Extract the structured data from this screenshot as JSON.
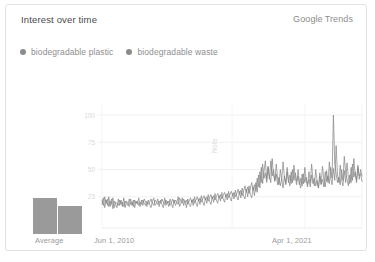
{
  "card": {
    "title": "Interest over time",
    "brand": {
      "google": "Google",
      "trends": "Trends"
    }
  },
  "legend": {
    "items": [
      {
        "label": "biodegradable plastic",
        "color": "#8c8c8c"
      },
      {
        "label": "biodegradable waste",
        "color": "#8c8c8c"
      }
    ]
  },
  "annotation": {
    "note": "Note"
  },
  "average": {
    "tick_label": "Average",
    "bars": [
      {
        "series": "biodegradable plastic",
        "value": 24
      },
      {
        "series": "biodegradable waste",
        "value": 19
      }
    ]
  },
  "axis": {
    "x_ticks": [
      "Jun 1, 2010",
      "Apr 1, 2021"
    ],
    "y_ticks": [
      "100",
      "75",
      "50",
      "25"
    ]
  },
  "chart_data": {
    "type": "line",
    "title": "Interest over time",
    "xlabel": "",
    "ylabel": "",
    "ylim": [
      0,
      100
    ],
    "grid": true,
    "legend_position": "top-left",
    "x_tick_labels": [
      "Jun 1, 2010",
      "Apr 1, 2021"
    ],
    "y_tick_labels": [
      100,
      75,
      50,
      25
    ],
    "series": [
      {
        "name": "biodegradable plastic",
        "color": "#8c8c8c",
        "values": [
          22,
          17,
          25,
          19,
          23,
          16,
          21,
          18,
          24,
          15,
          20,
          19,
          17,
          22,
          18,
          20,
          16,
          21,
          19,
          17,
          23,
          18,
          20,
          16,
          22,
          19,
          21,
          17,
          20,
          18,
          22,
          19,
          17,
          21,
          18,
          20,
          23,
          19,
          17,
          22,
          20,
          18,
          21,
          19,
          23,
          20,
          18,
          22,
          19,
          21,
          17,
          20,
          23,
          19,
          22,
          20,
          18,
          24,
          21,
          19,
          23,
          20,
          22,
          18,
          21,
          24,
          20,
          23,
          19,
          22,
          25,
          21,
          24,
          20,
          23,
          26,
          22,
          25,
          21,
          24,
          27,
          23,
          26,
          22,
          25,
          28,
          24,
          27,
          23,
          26,
          29,
          25,
          28,
          24,
          27,
          30,
          26,
          29,
          25,
          28,
          32,
          27,
          31,
          26,
          30,
          35,
          29,
          34,
          28,
          33,
          38,
          31,
          36,
          30,
          42,
          34,
          48,
          38,
          55,
          42,
          47,
          38,
          52,
          41,
          58,
          44,
          50,
          40,
          46,
          36,
          43,
          35,
          41,
          33,
          44,
          36,
          48,
          38,
          45,
          37,
          50,
          40,
          47,
          39,
          44,
          36,
          42,
          35,
          46,
          38,
          43,
          36,
          41,
          34,
          45,
          37,
          42,
          35,
          40,
          33,
          44,
          36,
          41,
          34,
          48,
          39,
          44,
          37,
          52,
          42,
          100,
          55,
          46,
          38,
          43,
          36,
          50,
          40,
          62,
          47,
          41,
          35,
          45,
          38,
          55,
          43,
          48,
          40,
          52,
          44,
          46,
          39
        ]
      },
      {
        "name": "biodegradable waste",
        "color": "#7d7d7d",
        "values": [
          18,
          24,
          15,
          22,
          17,
          25,
          16,
          23,
          14,
          21,
          18,
          15,
          23,
          17,
          22,
          16,
          24,
          15,
          21,
          19,
          16,
          23,
          17,
          22,
          15,
          21,
          18,
          24,
          16,
          22,
          17,
          23,
          20,
          16,
          22,
          18,
          15,
          21,
          24,
          17,
          19,
          23,
          16,
          22,
          18,
          15,
          24,
          17,
          21,
          16,
          23,
          19,
          15,
          22,
          17,
          20,
          25,
          16,
          19,
          24,
          17,
          21,
          15,
          23,
          18,
          16,
          22,
          17,
          25,
          19,
          16,
          23,
          18,
          26,
          20,
          17,
          24,
          19,
          27,
          21,
          18,
          25,
          20,
          28,
          22,
          19,
          26,
          21,
          29,
          23,
          20,
          27,
          22,
          30,
          24,
          21,
          28,
          23,
          31,
          25,
          22,
          30,
          24,
          33,
          26,
          23,
          32,
          25,
          35,
          27,
          24,
          34,
          26,
          38,
          29,
          45,
          33,
          52,
          37,
          48,
          58,
          41,
          53,
          44,
          38,
          60,
          45,
          39,
          55,
          42,
          36,
          50,
          40,
          57,
          43,
          37,
          52,
          41,
          35,
          48,
          38,
          54,
          42,
          36,
          50,
          39,
          33,
          46,
          37,
          52,
          40,
          34,
          48,
          38,
          55,
          41,
          35,
          50,
          39,
          33,
          47,
          37,
          53,
          40,
          34,
          49,
          38,
          57,
          42,
          36,
          51,
          40,
          72,
          45,
          38,
          54,
          41,
          35,
          49,
          38,
          56,
          43,
          37,
          52,
          40,
          60,
          45,
          38,
          54,
          41,
          50,
          44
        ]
      }
    ]
  }
}
